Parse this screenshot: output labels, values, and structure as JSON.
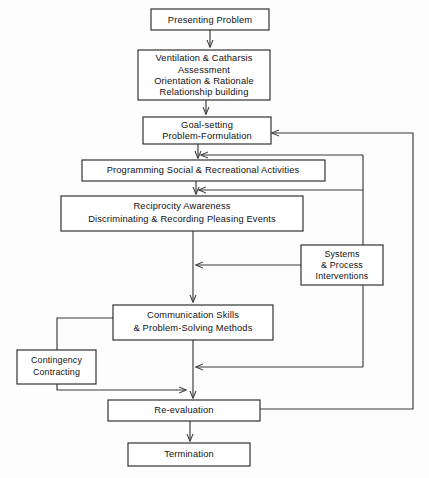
{
  "diagram": {
    "background_color": "#fdfdfd",
    "line_color": "#3a3a3a",
    "box_fill": "#ffffff",
    "nodes": [
      {
        "id": "presenting-problem",
        "lines": [
          "Presenting Problem"
        ]
      },
      {
        "id": "ventilation-assessment",
        "lines": [
          "Ventilation & Catharsis",
          "Assessment",
          "Orientation & Rationale",
          "Relationship building"
        ]
      },
      {
        "id": "goal-setting",
        "lines": [
          "Goal-setting",
          "Problem-Formulation"
        ]
      },
      {
        "id": "programming-activities",
        "lines": [
          "Programming Social & Recreational Activities"
        ]
      },
      {
        "id": "reciprocity-awareness",
        "lines": [
          "Reciprocity Awareness",
          "Discriminating & Recording Pleasing Events"
        ]
      },
      {
        "id": "systems-process",
        "lines": [
          "Systems",
          "& Process",
          "Interventions"
        ]
      },
      {
        "id": "communication-skills",
        "lines": [
          "Communication Skills",
          "& Problem-Solving Methods"
        ]
      },
      {
        "id": "contingency-contracting",
        "lines": [
          "Contingency",
          "Contracting"
        ]
      },
      {
        "id": "re-evaluation",
        "lines": [
          "Re-evaluation"
        ]
      },
      {
        "id": "termination",
        "lines": [
          "Termination"
        ]
      }
    ],
    "edges": [
      {
        "id": "presenting-to-ventilation",
        "type": "arrow-down"
      },
      {
        "id": "ventilation-to-goal",
        "type": "arrow-down"
      },
      {
        "id": "goal-to-programming",
        "type": "arrow-down"
      },
      {
        "id": "programming-to-reciprocity",
        "type": "arrow-down"
      },
      {
        "id": "reciprocity-to-communication",
        "type": "arrow-down"
      },
      {
        "id": "communication-to-reevaluation",
        "type": "arrow-down"
      },
      {
        "id": "reevaluation-to-termination",
        "type": "arrow-down"
      },
      {
        "id": "systems-to-trunk",
        "type": "arrow-left"
      },
      {
        "id": "communication-to-contingency",
        "type": "line"
      },
      {
        "id": "contingency-to-reevaluation",
        "type": "arrow-right"
      },
      {
        "id": "inner-feedback-to-goal-branch",
        "type": "arrow-left"
      },
      {
        "id": "inner-feedback-to-programming-branch",
        "type": "arrow-left"
      },
      {
        "id": "inner-feedback-to-reevaluation-branch",
        "type": "arrow-left"
      },
      {
        "id": "outer-feedback-reevaluation-to-goal",
        "type": "arrow-left"
      }
    ]
  }
}
